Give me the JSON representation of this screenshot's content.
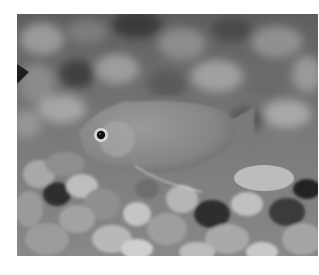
{
  "image": {
    "subject": "fish over gravel",
    "description": "Grayscale photograph of a small deep-bodied fish (gourami-like) with a long thin pelvic filament, swimming above a bed of rounded pebbles; blurred gravel background.",
    "colors": {
      "page_background": "#ffffff",
      "photo_mid_gray": "#6e6e6e",
      "fish_body": "#8a8a8a",
      "fish_eye_dark": "#111111",
      "pebble_light": "#bdbdbd",
      "pebble_dark": "#2a2a2a"
    }
  }
}
